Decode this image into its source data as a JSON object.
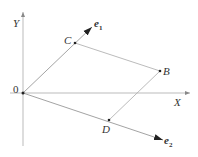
{
  "diagram": {
    "title": "",
    "axes": {
      "x_label": "X",
      "y_label": "Y",
      "origin_label": "0"
    },
    "points": [
      {
        "id": "C",
        "label": "C"
      },
      {
        "id": "B",
        "label": "B"
      },
      {
        "id": "D",
        "label": "D"
      }
    ],
    "vectors": [
      {
        "id": "e1",
        "base": "e",
        "subscript": "1"
      },
      {
        "id": "e2",
        "base": "e",
        "subscript": "2"
      }
    ],
    "relations": {
      "C_on": "e1",
      "D_on": "e2",
      "parallelogram": [
        "O",
        "C",
        "B",
        "D"
      ]
    },
    "colors": {
      "axis": "#aaaaaa",
      "vector": "#999999",
      "arrowhead": "#222222",
      "guide": "#aaaaaa",
      "point": "#222222",
      "text": "#333333"
    }
  }
}
